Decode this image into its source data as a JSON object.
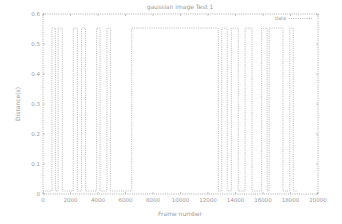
{
  "chart_data": {
    "type": "line",
    "title": "gaussian image Test 1",
    "xlabel": "Frame number",
    "ylabel": "Distance(s)",
    "xlim": [
      0,
      20000
    ],
    "ylim": [
      0,
      0.6
    ],
    "xticks": [
      0,
      2000,
      4000,
      6000,
      8000,
      10000,
      12000,
      14000,
      16000,
      18000,
      20000
    ],
    "yticks": [
      0,
      0.1,
      0.2,
      0.3,
      0.4,
      0.5,
      0.6
    ],
    "xtick_labels": [
      "0",
      "2000",
      "4000",
      "6000",
      "8000",
      "10000",
      "12000",
      "14000",
      "16000",
      "18000",
      "20000"
    ],
    "ytick_labels": [
      "0",
      "0.1",
      "0.2",
      "0.3",
      "0.4",
      "0.5",
      "0.6"
    ],
    "grid": false,
    "legend_position": "upper right",
    "series": [
      {
        "name": "data",
        "style": "dotted",
        "color": "#b0b0b0",
        "x": [
          0,
          650,
          650,
          900,
          900,
          1100,
          1100,
          1400,
          1400,
          2200,
          2200,
          2500,
          2500,
          2800,
          2800,
          3100,
          3100,
          3900,
          3900,
          4150,
          4150,
          4650,
          4650,
          4900,
          4900,
          6450,
          6450,
          12750,
          12750,
          13000,
          13000,
          13400,
          13400,
          13700,
          13700,
          14200,
          14200,
          14700,
          14700,
          15200,
          15200,
          15900,
          15900,
          16300,
          16300,
          16450,
          16450,
          17450,
          17450,
          17950,
          17950,
          18200,
          18200,
          18500
        ],
        "y": [
          0.01,
          0.01,
          0.553,
          0.553,
          0.01,
          0.01,
          0.553,
          0.553,
          0.01,
          0.01,
          0.553,
          0.553,
          0.01,
          0.01,
          0.553,
          0.553,
          0.01,
          0.01,
          0.553,
          0.553,
          0.01,
          0.01,
          0.553,
          0.553,
          0.01,
          0.01,
          0.553,
          0.553,
          0.01,
          0.01,
          0.553,
          0.553,
          0.01,
          0.01,
          0.553,
          0.553,
          0.01,
          0.01,
          0.553,
          0.553,
          0.01,
          0.01,
          0.553,
          0.553,
          0.01,
          0.01,
          0.553,
          0.553,
          0.01,
          0.01,
          0.553,
          0.553,
          0.01,
          0.01
        ]
      }
    ],
    "colors": {
      "frame": "#9a9a9a",
      "line": "#b0b0b0",
      "text": "#9a9a9a",
      "background": "#ffffff"
    }
  },
  "plot_area": {
    "left": 43,
    "top": 14,
    "right": 318,
    "bottom": 194
  }
}
